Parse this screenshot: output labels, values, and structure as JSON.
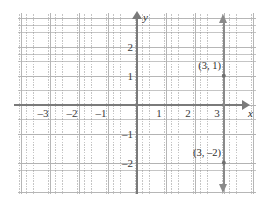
{
  "chart_data": {
    "type": "line",
    "title": "",
    "xlabel": "x",
    "ylabel": "y",
    "xlim": [
      -4,
      4
    ],
    "ylim": [
      -2.8,
      2.8
    ],
    "grid": true,
    "legend": "none",
    "equation": "x = 3",
    "series": [
      {
        "name": "x = 3",
        "type": "vertical-line",
        "x": 3,
        "arrow_top": true,
        "arrow_bottom": true
      }
    ],
    "points": [
      {
        "label": "(3, 1)",
        "x": 3,
        "y": 1
      },
      {
        "label": "(3, –2)",
        "x": 3,
        "y": -2
      }
    ],
    "x_ticks": [
      {
        "value": -3,
        "label": "–3"
      },
      {
        "value": -2,
        "label": "–2"
      },
      {
        "value": -1,
        "label": "–1"
      },
      {
        "value": 1,
        "label": "1"
      },
      {
        "value": 2,
        "label": "2"
      },
      {
        "value": 3,
        "label": "3"
      }
    ],
    "y_ticks": [
      {
        "value": 2,
        "label": "2"
      },
      {
        "value": 1,
        "label": "1"
      },
      {
        "value": -1,
        "label": "–1"
      },
      {
        "value": -2,
        "label": "–2"
      }
    ],
    "colors": {
      "axis": "#7a7a7a",
      "grid_major": "#b2b2b2",
      "grid_minor": "#969696",
      "plot_line": "#8a8a8a",
      "text": "#2d2d2d",
      "background": "#ffffff"
    }
  },
  "axes": {
    "x_name": "x",
    "y_name": "y"
  },
  "points": {
    "upper": {
      "label": "(3, 1)"
    },
    "lower": {
      "label": "(3, –2)"
    }
  }
}
